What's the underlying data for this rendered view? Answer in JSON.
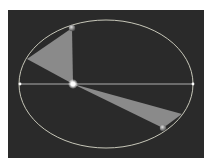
{
  "diagram": {
    "type": "kepler-second-law-orbit",
    "colors": {
      "background": "#2a2a2a",
      "orbit": "#d8d8c8",
      "sector": "#8a8a8a",
      "sun": "#ffffff",
      "planet": "#9a9a9a"
    },
    "orbit": {
      "cx": 106,
      "cy": 84,
      "rx": 87,
      "ry": 64
    },
    "major_axis": {
      "x1": 20,
      "y1": 84,
      "x2": 193,
      "y2": 84
    },
    "sun": {
      "x": 73,
      "y": 84
    },
    "sectors": [
      {
        "name": "aphelion-sector",
        "points": "73,84 72,28 27,59"
      },
      {
        "name": "perihelion-sector",
        "points": "73,84 182,114 163,128"
      }
    ],
    "planets": [
      {
        "name": "planet-near-aphelion",
        "x": 72,
        "y": 28
      },
      {
        "name": "planet-near-perihelion",
        "x": 163,
        "y": 128
      }
    ]
  }
}
